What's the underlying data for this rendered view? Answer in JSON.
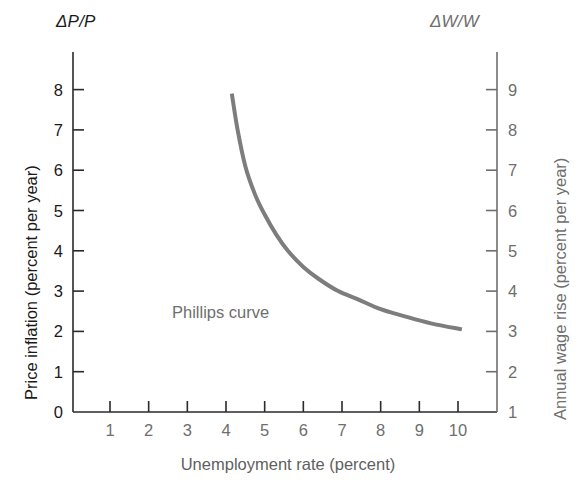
{
  "chart_data": {
    "type": "line",
    "title": "",
    "subtitle": "",
    "xlabel": "Unemployment rate (percent)",
    "ylabel": "Price inflation (percent per year)",
    "y2label": "Annual wage rise (percent per year)",
    "y_axis_symbol": "ΔP/P",
    "y2_axis_symbol": "ΔW/W",
    "xlim": [
      0,
      10.6
    ],
    "ylim": [
      0,
      8.6
    ],
    "y2lim": [
      1,
      9.6
    ],
    "xticks": [
      "1",
      "2",
      "3",
      "4",
      "5",
      "6",
      "7",
      "8",
      "9",
      "10"
    ],
    "xtick_values": [
      1,
      2,
      3,
      4,
      5,
      6,
      7,
      8,
      9,
      10
    ],
    "yticks": [
      "0",
      "1",
      "2",
      "3",
      "4",
      "5",
      "6",
      "7",
      "8"
    ],
    "ytick_values": [
      0,
      1,
      2,
      3,
      4,
      5,
      6,
      7,
      8
    ],
    "y2ticks": [
      "1",
      "2",
      "3",
      "4",
      "5",
      "6",
      "7",
      "8",
      "9"
    ],
    "y2tick_values": [
      1,
      2,
      3,
      4,
      5,
      6,
      7,
      8,
      9
    ],
    "grid": false,
    "legend_position": "inline-annotation",
    "annotations": [
      {
        "text": "Phillips curve",
        "x": 4.6,
        "y": 2.6
      }
    ],
    "series": [
      {
        "name": "Phillips curve",
        "color": "#7d7d7d",
        "line_width": 4,
        "x": [
          4.15,
          4.3,
          4.5,
          4.75,
          5.0,
          5.3,
          5.6,
          6.0,
          6.4,
          6.9,
          7.4,
          8.0,
          8.6,
          9.3,
          10.1
        ],
        "y": [
          7.9,
          7.0,
          6.1,
          5.4,
          4.9,
          4.4,
          4.0,
          3.6,
          3.3,
          3.0,
          2.8,
          2.55,
          2.38,
          2.2,
          2.05
        ]
      }
    ]
  }
}
